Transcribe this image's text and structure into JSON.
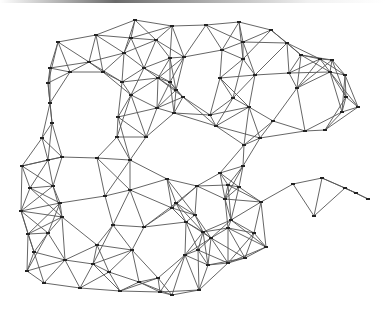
{
  "diagram": {
    "type": "triangulated-mesh",
    "edge_color": "#555555",
    "node_color": "#222222",
    "background": "#ffffff",
    "nodes": [
      [
        58,
        42
      ],
      [
        96,
        35
      ],
      [
        135,
        20
      ],
      [
        172,
        26
      ],
      [
        206,
        25
      ],
      [
        239,
        22
      ],
      [
        271,
        30
      ],
      [
        287,
        43
      ],
      [
        320,
        59
      ],
      [
        332,
        60
      ],
      [
        345,
        75
      ],
      [
        358,
        107
      ],
      [
        124,
        53
      ],
      [
        131,
        38
      ],
      [
        89,
        62
      ],
      [
        70,
        72
      ],
      [
        103,
        72
      ],
      [
        156,
        40
      ],
      [
        144,
        68
      ],
      [
        158,
        78
      ],
      [
        50,
        68
      ],
      [
        48,
        83
      ],
      [
        170,
        58
      ],
      [
        184,
        57
      ],
      [
        122,
        82
      ],
      [
        131,
        95
      ],
      [
        50,
        103
      ],
      [
        118,
        117
      ],
      [
        157,
        108
      ],
      [
        176,
        90
      ],
      [
        183,
        97
      ],
      [
        174,
        113
      ],
      [
        170,
        82
      ],
      [
        52,
        123
      ],
      [
        117,
        137
      ],
      [
        146,
        137
      ],
      [
        42,
        138
      ],
      [
        243,
        42
      ],
      [
        222,
        50
      ],
      [
        243,
        59
      ],
      [
        301,
        55
      ],
      [
        330,
        72
      ],
      [
        289,
        73
      ],
      [
        220,
        78
      ],
      [
        255,
        75
      ],
      [
        297,
        88
      ],
      [
        233,
        98
      ],
      [
        249,
        107
      ],
      [
        346,
        97
      ],
      [
        273,
        121
      ],
      [
        216,
        126
      ],
      [
        210,
        115
      ],
      [
        305,
        131
      ],
      [
        260,
        138
      ],
      [
        244,
        145
      ],
      [
        342,
        112
      ],
      [
        325,
        130
      ],
      [
        22,
        166
      ],
      [
        48,
        160
      ],
      [
        62,
        157
      ],
      [
        97,
        158
      ],
      [
        130,
        160
      ],
      [
        30,
        188
      ],
      [
        53,
        186
      ],
      [
        105,
        196
      ],
      [
        130,
        190
      ],
      [
        60,
        203
      ],
      [
        167,
        179
      ],
      [
        21,
        211
      ],
      [
        62,
        217
      ],
      [
        113,
        225
      ],
      [
        144,
        227
      ],
      [
        28,
        234
      ],
      [
        48,
        233
      ],
      [
        97,
        245
      ],
      [
        132,
        250
      ],
      [
        34,
        252
      ],
      [
        65,
        260
      ],
      [
        93,
        264
      ],
      [
        27,
        271
      ],
      [
        109,
        272
      ],
      [
        44,
        283
      ],
      [
        80,
        288
      ],
      [
        120,
        291
      ],
      [
        158,
        278
      ],
      [
        160,
        292
      ],
      [
        186,
        222
      ],
      [
        172,
        208
      ],
      [
        176,
        203
      ],
      [
        139,
        282
      ],
      [
        185,
        255
      ],
      [
        172,
        295
      ],
      [
        239,
        187
      ],
      [
        293,
        184
      ],
      [
        261,
        202
      ],
      [
        197,
        186
      ],
      [
        228,
        185
      ],
      [
        225,
        199
      ],
      [
        195,
        215
      ],
      [
        231,
        220
      ],
      [
        203,
        232
      ],
      [
        211,
        238
      ],
      [
        228,
        228
      ],
      [
        254,
        233
      ],
      [
        345,
        188
      ],
      [
        322,
        178
      ],
      [
        356,
        193
      ],
      [
        368,
        199
      ],
      [
        314,
        216
      ],
      [
        266,
        247
      ],
      [
        228,
        263
      ],
      [
        245,
        258
      ],
      [
        208,
        265
      ],
      [
        198,
        250
      ],
      [
        243,
        166
      ],
      [
        220,
        173
      ],
      [
        199,
        290
      ]
    ],
    "max_edge_length": 46
  }
}
